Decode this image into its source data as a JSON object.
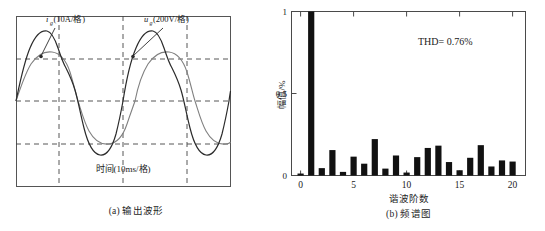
{
  "figure_a": {
    "caption": "(a) 输出波形",
    "label_current": "i",
    "label_current_sub": "g",
    "label_current_unit": "(10A/格)",
    "label_voltage": "u",
    "label_voltage_sub": "g",
    "label_voltage_unit": "(200V/格)",
    "time_axis": "时间(10ms/格)"
  },
  "figure_b": {
    "caption": "(b) 频谱图",
    "thd_text": "THD= 0.76%",
    "xlabel": "谐波阶数",
    "ylabel": "幅值/%",
    "ytick_0": "0",
    "ytick_05": "0.5",
    "ytick_1": "1",
    "xtick_0": "0",
    "xtick_5": "5",
    "xtick_10": "10",
    "xtick_15": "15",
    "xtick_20": "20"
  },
  "chart_data": [
    {
      "type": "line",
      "title": "(a) 输出波形",
      "xlabel": "时间(10ms/格)",
      "ylabel": "",
      "grid": true,
      "xlim": [
        0,
        3
      ],
      "ylim": [
        -1.25,
        1.25
      ],
      "annotations": [
        "i_g(10A/格)",
        "u_g(200V/格)"
      ],
      "series": [
        {
          "name": "i_g(10A/格)",
          "description": "grid current, flat-topped distorted sine, 3 cycles, peak amplitude 1.0",
          "amplitude": 1.0,
          "cycles": 3,
          "color": "#333333"
        },
        {
          "name": "u_g(200V/格)",
          "description": "grid voltage, smooth sine, 3 cycles, peak amplitude 0.62",
          "amplitude": 0.62,
          "cycles": 3,
          "color": "#777777"
        }
      ]
    },
    {
      "type": "bar",
      "title": "(b) 频谱图",
      "xlabel": "谐波阶数",
      "ylabel": "幅值/%",
      "annotation": "THD= 0.76%",
      "xlim": [
        -0.8,
        20.8
      ],
      "ylim": [
        0,
        1
      ],
      "xticks": [
        0,
        5,
        10,
        15,
        20
      ],
      "yticks": [
        0,
        0.5,
        1
      ],
      "grid": false,
      "categories": [
        0,
        1,
        2,
        3,
        4,
        5,
        6,
        7,
        8,
        9,
        10,
        11,
        12,
        13,
        14,
        15,
        16,
        17,
        18,
        19,
        20
      ],
      "values": [
        0.012,
        1.0,
        0.045,
        0.155,
        0.022,
        0.115,
        0.072,
        0.222,
        0.042,
        0.122,
        0.018,
        0.112,
        0.168,
        0.182,
        0.082,
        0.032,
        0.108,
        0.185,
        0.055,
        0.092,
        0.085
      ],
      "bar_color": "#111111"
    }
  ]
}
